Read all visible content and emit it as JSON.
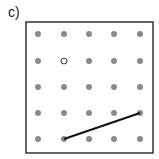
{
  "label": "c)",
  "grid": {
    "rows": 5,
    "cols": 5,
    "dot_color": "#8a8a8a",
    "x_positions": [
      38,
      64,
      89,
      114,
      140
    ],
    "y_positions": [
      34,
      61,
      87,
      113,
      139
    ]
  },
  "open_dot": {
    "col": 1,
    "row": 1
  },
  "segment": {
    "from": {
      "col": 1,
      "row": 4
    },
    "to": {
      "col": 4,
      "row": 3
    }
  },
  "box": {
    "x": 26,
    "y": 22,
    "width": 127,
    "height": 131
  }
}
